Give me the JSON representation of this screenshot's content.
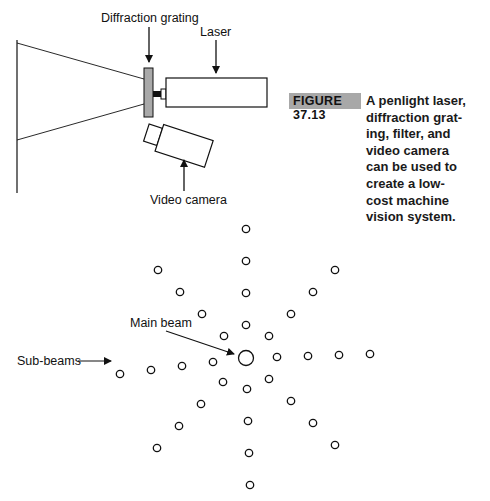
{
  "figure": {
    "number_label": "FIGURE 37.13",
    "caption_lines": [
      "A penlight laser,",
      "diffraction grat-",
      "ing, filter, and",
      "video camera",
      "can be used to",
      "create a low-",
      "cost machine",
      "vision system."
    ]
  },
  "setup_diagram": {
    "labels": {
      "diffraction_grating": "Diffraction grating",
      "laser": "Laser",
      "video_camera": "Video camera"
    },
    "colors": {
      "grating_fill": "#a9a9a9",
      "line": "#111111"
    }
  },
  "beam_pattern": {
    "labels": {
      "main_beam": "Main beam",
      "sub_beams": "Sub-beams"
    },
    "main_beam_count": 1,
    "arms": 8,
    "sub_beams_per_arm": 4
  }
}
